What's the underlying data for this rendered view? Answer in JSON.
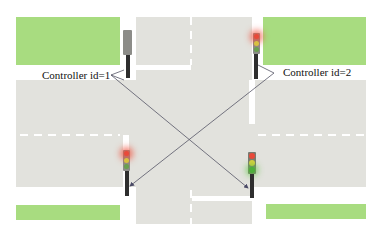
{
  "diagram": {
    "type": "traffic-intersection",
    "caption_partial": "",
    "controllers": [
      {
        "id": 1,
        "label": "Controller id=1"
      },
      {
        "id": 2,
        "label": "Controller id=2"
      }
    ],
    "traffic_lights": [
      {
        "position": "top-left",
        "state": "off",
        "controller_id": 1
      },
      {
        "position": "top-right",
        "state": "red",
        "controller_id": 2
      },
      {
        "position": "bottom-left",
        "state": "red",
        "controller_id": 2
      },
      {
        "position": "bottom-right",
        "state": "green",
        "controller_id": 1
      }
    ],
    "colors": {
      "grass": "#a8dc80",
      "road": "#e2e2dd",
      "lane_marking": "#ffffff",
      "red_light": "#e84a3a",
      "yellow_light": "#d8d040",
      "green_light": "#4caf3a",
      "connector_line": "#555566"
    }
  }
}
